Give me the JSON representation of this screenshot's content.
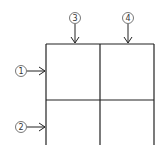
{
  "diagram": {
    "title": "",
    "colors": {
      "line": "#222222",
      "circle": "#555555",
      "background": "#ffffff"
    },
    "markers": [
      {
        "id": "marker-1",
        "label": "①",
        "number": "1",
        "direction": "right",
        "target": "left-edge-row-1"
      },
      {
        "id": "marker-2",
        "label": "②",
        "number": "2",
        "direction": "right",
        "target": "left-edge-row-2"
      },
      {
        "id": "marker-3",
        "label": "③",
        "number": "3",
        "direction": "down",
        "target": "top-edge-col-1"
      },
      {
        "id": "marker-4",
        "label": "④",
        "number": "4",
        "direction": "down",
        "target": "top-edge-col-2"
      }
    ],
    "grid": {
      "columns": 2,
      "rows_visible": 2
    }
  }
}
